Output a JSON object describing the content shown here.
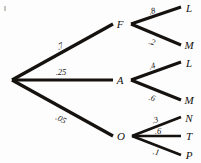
{
  "diagram": {
    "type": "probability-tree",
    "title": "",
    "background_color": "#fdfdfd",
    "line_color": "#15120f",
    "text_color": "#14110f",
    "root": {
      "label": "",
      "x": 12,
      "y": 80
    },
    "level1": [
      {
        "id": "F",
        "label": "F",
        "probability": ".7",
        "x": 120,
        "y": 24,
        "branch_x": 131,
        "branch_y": 24
      },
      {
        "id": "A",
        "label": "A",
        "probability": ".25",
        "x": 120,
        "y": 80,
        "branch_x": 131,
        "branch_y": 80
      },
      {
        "id": "O",
        "label": "O",
        "probability": ".05",
        "x": 121,
        "y": 136,
        "branch_x": 132,
        "branch_y": 136
      }
    ],
    "level2": [
      {
        "parent": "F",
        "id": "FL",
        "label": "L",
        "probability": ".8",
        "x": 189,
        "y": 8
      },
      {
        "parent": "F",
        "id": "FM",
        "label": "M",
        "probability": ".2",
        "x": 189,
        "y": 45
      },
      {
        "parent": "A",
        "id": "AL",
        "label": "L",
        "probability": ".4",
        "x": 189,
        "y": 63
      },
      {
        "parent": "A",
        "id": "AM",
        "label": "M",
        "probability": ".6",
        "x": 189,
        "y": 100
      },
      {
        "parent": "O",
        "id": "ON",
        "label": "N",
        "probability": ".3",
        "x": 189,
        "y": 118
      },
      {
        "parent": "O",
        "id": "OT",
        "label": "T",
        "probability": ".6",
        "x": 189,
        "y": 136
      },
      {
        "parent": "O",
        "id": "OP",
        "label": "P",
        "probability": ".1",
        "x": 189,
        "y": 155
      }
    ],
    "edge_label_positions": [
      {
        "id": "e-root-F",
        "text": ".7",
        "x": 60,
        "y": 46,
        "rotate": -27
      },
      {
        "id": "e-root-A",
        "text": ".25",
        "x": 61,
        "y": 72,
        "rotate": 0
      },
      {
        "id": "e-root-O",
        "text": ".05",
        "x": 61,
        "y": 119,
        "rotate": 27
      },
      {
        "id": "e-F-L",
        "text": ".8",
        "x": 152,
        "y": 11,
        "rotate": -16
      },
      {
        "id": "e-F-M",
        "text": ".2",
        "x": 152,
        "y": 42,
        "rotate": 16
      },
      {
        "id": "e-A-L",
        "text": ".4",
        "x": 152,
        "y": 66,
        "rotate": -16
      },
      {
        "id": "e-A-M",
        "text": ".6",
        "x": 152,
        "y": 98,
        "rotate": 16
      },
      {
        "id": "e-O-N",
        "text": ".3",
        "x": 155,
        "y": 120,
        "rotate": -17
      },
      {
        "id": "e-O-T",
        "text": ".6",
        "x": 158,
        "y": 131,
        "rotate": 0
      },
      {
        "id": "e-O-P",
        "text": ".1",
        "x": 156,
        "y": 152,
        "rotate": 12
      }
    ],
    "edges": [
      {
        "id": "root-F",
        "x1": 12,
        "y1": 80,
        "x2": 113,
        "y2": 24,
        "width": 3.2
      },
      {
        "id": "root-A",
        "x1": 12,
        "y1": 80,
        "x2": 113,
        "y2": 80,
        "width": 3.2
      },
      {
        "id": "root-O",
        "x1": 12,
        "y1": 80,
        "x2": 113,
        "y2": 136,
        "width": 3.2
      },
      {
        "id": "F-L",
        "x1": 131,
        "y1": 24,
        "x2": 181,
        "y2": 7,
        "width": 3.0
      },
      {
        "id": "F-M",
        "x1": 131,
        "y1": 24,
        "x2": 181,
        "y2": 45,
        "width": 3.0
      },
      {
        "id": "A-L",
        "x1": 131,
        "y1": 80,
        "x2": 181,
        "y2": 62,
        "width": 3.0
      },
      {
        "id": "A-M",
        "x1": 131,
        "y1": 80,
        "x2": 181,
        "y2": 100,
        "width": 3.0
      },
      {
        "id": "O-N",
        "x1": 132,
        "y1": 136,
        "x2": 181,
        "y2": 117,
        "width": 2.8
      },
      {
        "id": "O-T",
        "x1": 132,
        "y1": 136,
        "x2": 181,
        "y2": 136,
        "width": 2.6
      },
      {
        "id": "O-P",
        "x1": 132,
        "y1": 136,
        "x2": 181,
        "y2": 155,
        "width": 2.8
      }
    ]
  }
}
